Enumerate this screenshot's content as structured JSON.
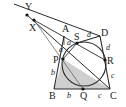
{
  "diagram": {
    "type": "geometry",
    "colors": {
      "line": "#2a2a2a",
      "thin_line": "#555555",
      "fill": "#cfcfcf",
      "point": "#111111"
    },
    "points": {
      "Y": {
        "label": "Y",
        "x": 27,
        "y": 15
      },
      "X": {
        "label": "X",
        "x": 34,
        "y": 20
      },
      "A": {
        "label": "A",
        "x": 64,
        "y": 36
      },
      "S": {
        "label": "S",
        "x": 77,
        "y": 43
      },
      "D": {
        "label": "D",
        "x": 100,
        "y": 36
      },
      "P": {
        "label": "P",
        "x": 63,
        "y": 59
      },
      "R": {
        "label": "R",
        "x": 105,
        "y": 60
      },
      "B": {
        "label": "B",
        "x": 54,
        "y": 89
      },
      "Q": {
        "label": "Q",
        "x": 83,
        "y": 89
      },
      "C": {
        "label": "C",
        "x": 110,
        "y": 89
      }
    },
    "circle": {
      "cx": 84,
      "cy": 64,
      "r": 22
    },
    "segment_labels": [
      {
        "text": "a",
        "near": "AS"
      },
      {
        "text": "a",
        "near": "AP"
      },
      {
        "text": "d",
        "near": "SD"
      },
      {
        "text": "d",
        "near": "DR"
      },
      {
        "text": "b",
        "near": "PB"
      },
      {
        "text": "b",
        "near": "BQ"
      },
      {
        "text": "c",
        "near": "QC"
      },
      {
        "text": "c",
        "near": "RC"
      }
    ]
  }
}
